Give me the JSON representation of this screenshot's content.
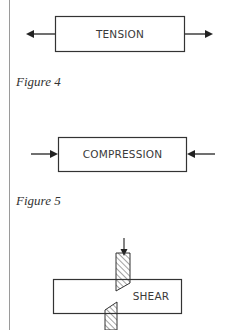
{
  "figures": [
    {
      "id": "tension",
      "label": "TENSION",
      "caption": "Figure 4"
    },
    {
      "id": "compression",
      "label": "COMPRESSION",
      "caption": "Figure 5"
    },
    {
      "id": "shear",
      "label": "SHEAR"
    }
  ],
  "colors": {
    "line": "#333333",
    "text": "#3a3a3a",
    "rule": "#9a9a9a"
  }
}
